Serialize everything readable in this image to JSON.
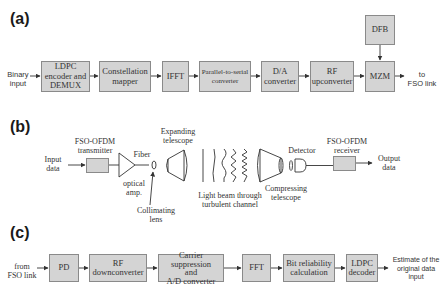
{
  "panels": {
    "a": {
      "label": "(a)",
      "input_label": [
        "Binary",
        "input"
      ],
      "blocks": [
        {
          "id": "ldpc-encoder",
          "text": [
            "LDPC",
            "encoder and",
            "DEMUX"
          ]
        },
        {
          "id": "constellation-mapper",
          "text": [
            "Constellation",
            "mapper"
          ]
        },
        {
          "id": "ifft",
          "text": [
            "IFFT"
          ]
        },
        {
          "id": "parallel-to-serial",
          "text": [
            "Parallel-to-serial",
            "converter"
          ]
        },
        {
          "id": "da-converter",
          "text": [
            "D/A",
            "converter"
          ]
        },
        {
          "id": "rf-upconverter",
          "text": [
            "RF",
            "upconverter"
          ]
        },
        {
          "id": "mzm",
          "text": [
            "MZM"
          ]
        },
        {
          "id": "dfb",
          "text": [
            "DFB"
          ]
        }
      ],
      "output_label": [
        "to",
        "FSO link"
      ]
    },
    "b": {
      "label": "(b)",
      "input_label": [
        "Input",
        "data"
      ],
      "transmitter_label": [
        "FSO-OFDM",
        "transmitter"
      ],
      "fiber_label": "Fiber",
      "amp_label": [
        "optical",
        "amp."
      ],
      "collimating_label": [
        "Collimating",
        "lens"
      ],
      "expanding_label": [
        "Expanding",
        "telescope"
      ],
      "channel_label": [
        "Light beam through",
        "turbulent channel"
      ],
      "compressing_label": [
        "Compressing",
        "telescope"
      ],
      "detector_label": "Detector",
      "receiver_label": [
        "FSO-OFDM",
        "receiver"
      ],
      "output_label": [
        "Output",
        "data"
      ]
    },
    "c": {
      "label": "(c)",
      "input_label": [
        "from",
        "FSO link"
      ],
      "blocks": [
        {
          "id": "pd",
          "text": [
            "PD"
          ]
        },
        {
          "id": "rf-downconverter",
          "text": [
            "RF",
            "downconverter"
          ]
        },
        {
          "id": "carrier-suppression",
          "text": [
            "Carrier suppression",
            "and",
            "A/D converter"
          ]
        },
        {
          "id": "fft",
          "text": [
            "FFT"
          ]
        },
        {
          "id": "bit-reliability",
          "text": [
            "Bit reliability",
            "calculation"
          ]
        },
        {
          "id": "ldpc-decoder",
          "text": [
            "LDPC",
            "decoder"
          ]
        }
      ],
      "output_label": [
        "Estimate of the",
        "original data",
        "input"
      ]
    }
  },
  "colors": {
    "box_fill": "#d4d4d4",
    "box_border": "#8a8a8a",
    "line": "#333333"
  }
}
